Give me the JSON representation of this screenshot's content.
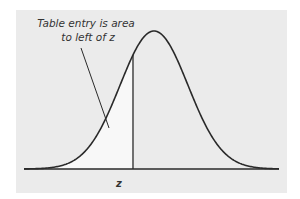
{
  "figure": {
    "annotation_lines": [
      "Table entry is area",
      "to left of z"
    ],
    "z_label": "z",
    "colors": {
      "panel": "#ebebeb",
      "shaded_area": "#f8f8f8",
      "curve": "#2a2a2a",
      "text": "#333333"
    }
  },
  "chart_data": {
    "type": "area",
    "title": "",
    "xlabel": "",
    "ylabel": "",
    "distribution": "standard normal",
    "curve": "bell-shaped density",
    "shaded_region": "area under curve to the left of z",
    "z_marker_position_sd": -0.6,
    "annotations": [
      "Table entry is area",
      "to left of z"
    ],
    "tick_labels": [
      "z"
    ],
    "grid": false,
    "legend": null
  }
}
